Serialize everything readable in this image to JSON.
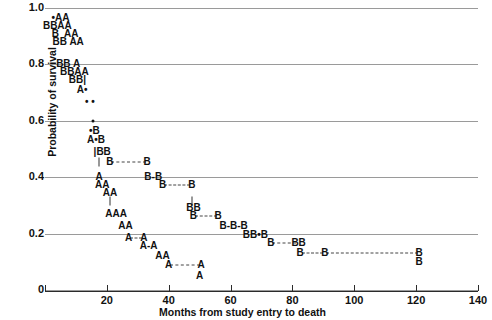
{
  "chart_data": {
    "type": "scatter",
    "title": "",
    "xlabel": "Months from study entry to death",
    "ylabel": "Probability of survival",
    "xlim": [
      0,
      140
    ],
    "ylim": [
      0,
      1.0
    ],
    "grid": true,
    "legend_position": "none",
    "x_ticks": [
      20,
      40,
      60,
      80,
      100,
      120,
      140
    ],
    "x_tick_labels": [
      "20",
      "40",
      "60",
      "80",
      "100",
      "120",
      "140"
    ],
    "y_ticks": [
      0,
      0.2,
      0.4,
      0.6,
      0.8,
      1.0
    ],
    "y_tick_labels": [
      "0",
      "0.2",
      "0.4",
      "0.6",
      "0.8",
      "1.0"
    ],
    "gridlines_y": [
      0,
      0.2,
      0.4,
      0.6,
      0.8,
      1.0
    ],
    "series": [
      {
        "name": "A",
        "marker": "A"
      },
      {
        "name": "B",
        "marker": "B"
      },
      {
        "name": "censored",
        "marker": "dot"
      }
    ],
    "points": [
      {
        "label": "•AA",
        "x": 5.0,
        "y": 0.965
      },
      {
        "label": "BBAA",
        "x": 4.0,
        "y": 0.937
      },
      {
        "label": "B  AA",
        "x": 6.5,
        "y": 0.909
      },
      {
        "label": "BB AA",
        "x": 7.5,
        "y": 0.881
      },
      {
        "label": "BB A",
        "x": 7.5,
        "y": 0.8
      },
      {
        "label": "BBAA",
        "x": 9.5,
        "y": 0.772
      },
      {
        "label": "BB|",
        "x": 10.5,
        "y": 0.744
      },
      {
        "label": "A•",
        "x": 12.0,
        "y": 0.71
      },
      {
        "label": "• •",
        "x": 14.5,
        "y": 0.668
      },
      {
        "label": "•",
        "x": 15.5,
        "y": 0.6
      },
      {
        "label": "•B",
        "x": 16.0,
        "y": 0.565
      },
      {
        "label": "A•B",
        "x": 16.5,
        "y": 0.533
      },
      {
        "label": "|BB",
        "x": 18.5,
        "y": 0.49
      },
      {
        "label": "|",
        "x": 17.5,
        "y": 0.455
      },
      {
        "label": "B",
        "x": 21.0,
        "y": 0.455
      },
      {
        "label": "B",
        "x": 33.0,
        "y": 0.455
      },
      {
        "label": "A",
        "x": 17.5,
        "y": 0.4
      },
      {
        "label": "B-B",
        "x": 35.0,
        "y": 0.4
      },
      {
        "label": "AA",
        "x": 18.5,
        "y": 0.372
      },
      {
        "label": "B",
        "x": 38.0,
        "y": 0.372
      },
      {
        "label": "B",
        "x": 47.5,
        "y": 0.372
      },
      {
        "label": "AA",
        "x": 21.0,
        "y": 0.345
      },
      {
        "label": "|",
        "x": 21.0,
        "y": 0.317
      },
      {
        "label": "|",
        "x": 47.5,
        "y": 0.317
      },
      {
        "label": "BB",
        "x": 48.0,
        "y": 0.29
      },
      {
        "label": "AAA",
        "x": 23.0,
        "y": 0.268
      },
      {
        "label": "B",
        "x": 48.0,
        "y": 0.262
      },
      {
        "label": "B",
        "x": 56.0,
        "y": 0.262
      },
      {
        "label": "AA",
        "x": 26.0,
        "y": 0.226
      },
      {
        "label": "B-B-B",
        "x": 61.0,
        "y": 0.226
      },
      {
        "label": "BB•B",
        "x": 68.0,
        "y": 0.196
      },
      {
        "label": "A",
        "x": 27.0,
        "y": 0.184
      },
      {
        "label": "A",
        "x": 32.0,
        "y": 0.184
      },
      {
        "label": "B",
        "x": 73.0,
        "y": 0.166
      },
      {
        "label": "BB",
        "x": 82.0,
        "y": 0.166
      },
      {
        "label": "A-A",
        "x": 33.5,
        "y": 0.155
      },
      {
        "label": "B",
        "x": 82.5,
        "y": 0.131
      },
      {
        "label": "B",
        "x": 90.5,
        "y": 0.131
      },
      {
        "label": "B",
        "x": 121.0,
        "y": 0.131
      },
      {
        "label": "AA",
        "x": 38.0,
        "y": 0.122
      },
      {
        "label": "A",
        "x": 40.0,
        "y": 0.09
      },
      {
        "label": "A",
        "x": 50.5,
        "y": 0.09
      },
      {
        "label": "B",
        "x": 121.0,
        "y": 0.098
      },
      {
        "label": "A",
        "x": 50.0,
        "y": 0.048
      }
    ],
    "censor_segments": [
      {
        "x0": 21.5,
        "x1": 32.5,
        "y": 0.455
      },
      {
        "x0": 38.5,
        "x1": 47.0,
        "y": 0.372
      },
      {
        "x0": 48.5,
        "x1": 55.5,
        "y": 0.262
      },
      {
        "x0": 73.5,
        "x1": 81.0,
        "y": 0.166
      },
      {
        "x0": 83.0,
        "x1": 90.0,
        "y": 0.131
      },
      {
        "x0": 91.0,
        "x1": 120.5,
        "y": 0.131
      },
      {
        "x0": 27.5,
        "x1": 31.5,
        "y": 0.184
      },
      {
        "x0": 40.5,
        "x1": 50.0,
        "y": 0.09
      }
    ]
  }
}
